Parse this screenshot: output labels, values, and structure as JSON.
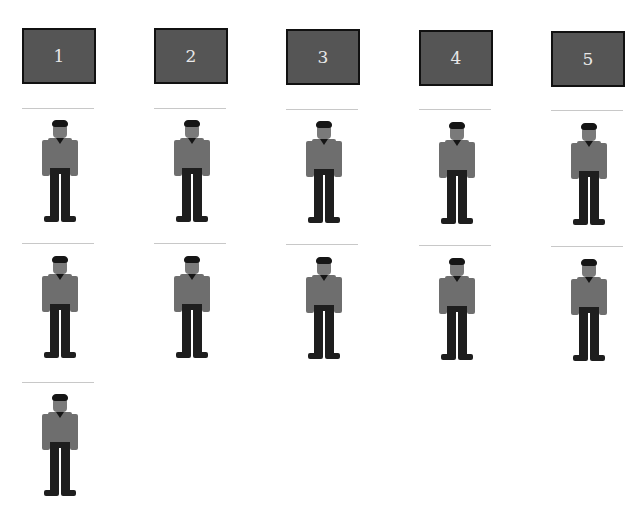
{
  "diagram": {
    "columns": [
      {
        "label": "1",
        "persons": 3
      },
      {
        "label": "2",
        "persons": 2
      },
      {
        "label": "3",
        "persons": 2
      },
      {
        "label": "4",
        "persons": 2
      },
      {
        "label": "5",
        "persons": 2
      }
    ],
    "icon": "person-icon",
    "colors": {
      "box_fill": "#555555",
      "box_border": "#111111",
      "box_text": "#e8e8e8",
      "shirt": "#6e6e6e",
      "pants": "#1e1e1e",
      "skin": "#7a7a7a",
      "hair": "#151515",
      "rule": "#c8c8c8"
    }
  }
}
